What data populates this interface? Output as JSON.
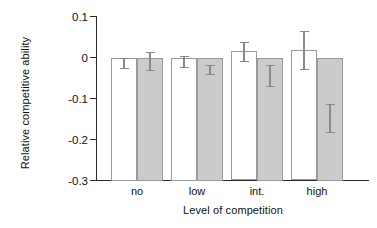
{
  "chart_data": {
    "type": "bar",
    "title": "",
    "xlabel": "Level of competition",
    "ylabel": "Relative competitive ability",
    "categories": [
      "no",
      "low",
      "int.",
      "high"
    ],
    "ylim": [
      -0.3,
      0.1
    ],
    "yticks": [
      0.1,
      0,
      -0.1,
      -0.2,
      -0.3
    ],
    "ytick_labels": [
      "0.1",
      "0",
      "-0.1",
      "-0.2",
      "-0.3"
    ],
    "grid": false,
    "legend": "none",
    "series": [
      {
        "name": "open",
        "fill": "#ffffff",
        "values": [
          -0.013,
          -0.01,
          0.015,
          0.019
        ],
        "errors": [
          0.012,
          0.013,
          0.023,
          0.046
        ]
      },
      {
        "name": "shaded",
        "fill": "#cbcbcb",
        "values": [
          -0.008,
          -0.03,
          -0.044,
          -0.147
        ]
      }
    ]
  },
  "axis": {
    "y_title": "Relative competitive ability",
    "x_title": "Level of competition",
    "ticks": [
      {
        "label": "0.1",
        "value": 0.1
      },
      {
        "label": "0",
        "value": 0
      },
      {
        "label": "-0.1",
        "value": -0.1
      },
      {
        "label": "-0.2",
        "value": -0.2
      },
      {
        "label": "-0.3",
        "value": -0.3
      }
    ],
    "categories": [
      {
        "label": "no"
      },
      {
        "label": "low"
      },
      {
        "label": "int."
      },
      {
        "label": "high"
      }
    ]
  },
  "colors": {
    "axis": "#2b2b2b",
    "bar_open": "#ffffff",
    "bar_shaded": "#cbcbcb",
    "bar_outline": "#9a9a9a",
    "error": "#8a8a8a",
    "background": "#ffffff"
  }
}
